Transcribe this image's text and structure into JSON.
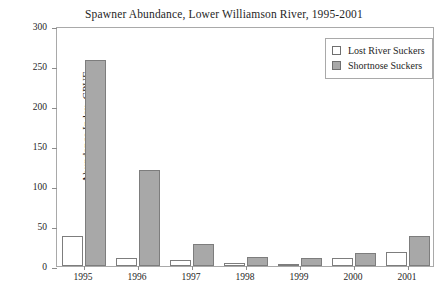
{
  "chart_data": {
    "type": "bar",
    "title": "Spawner Abundance, Lower Williamson River, 1995-2001",
    "xlabel": "",
    "ylabel": "Abundance Index, CPUE",
    "categories": [
      "1995",
      "1996",
      "1997",
      "1998",
      "1999",
      "2000",
      "2001"
    ],
    "series": [
      {
        "name": "Lost River Suckers",
        "color": "#ffffff",
        "values": [
          38,
          10,
          8,
          4,
          2,
          10,
          18
        ]
      },
      {
        "name": "Shortnose Suckers",
        "color": "#a8a8a8",
        "values": [
          258,
          120,
          28,
          11,
          10,
          16,
          38
        ]
      }
    ],
    "ylim": [
      0,
      300
    ],
    "yticks": [
      0,
      50,
      100,
      150,
      200,
      250,
      300
    ],
    "ytick_labels": [
      "0",
      "50",
      "100",
      "150",
      "200",
      "250",
      "300"
    ],
    "grid": false,
    "legend_position": "top-right"
  }
}
